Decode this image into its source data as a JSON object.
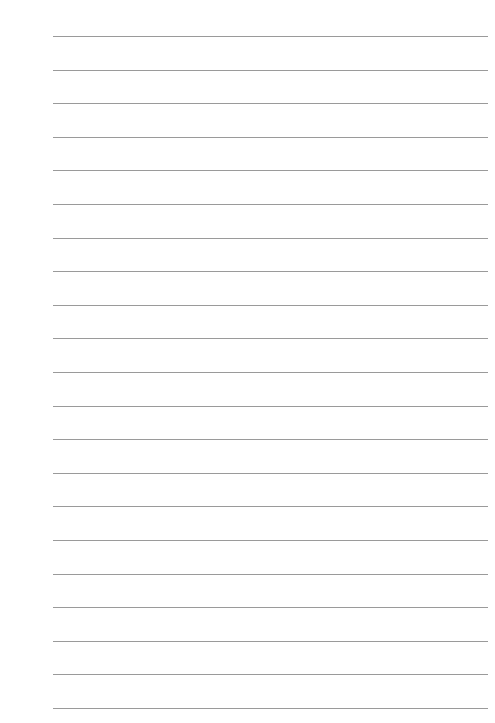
{
  "page": {
    "type": "lined-paper",
    "background": "#ffffff",
    "line_color": "#9a9a9a",
    "line_count": 21,
    "line_left": 53,
    "line_right": 488,
    "first_line_y": 36,
    "line_spacing": 33.6
  }
}
